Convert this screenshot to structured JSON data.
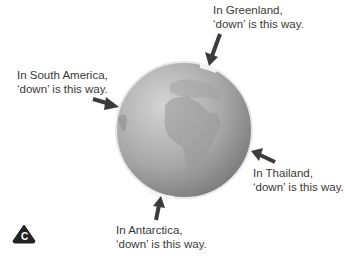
{
  "diagram": {
    "labels": [
      {
        "id": "greenland",
        "line1": "In Greenland,",
        "line2": "‘down’ is this way."
      },
      {
        "id": "south-america",
        "line1": "In South America,",
        "line2": "‘down’ is this way."
      },
      {
        "id": "thailand",
        "line1": "In Thailand,",
        "line2": "‘down’ is this way."
      },
      {
        "id": "antarctica",
        "line1": "In Antarctica,",
        "line2": "‘down’ is this way."
      }
    ],
    "badge": {
      "letter": "C"
    },
    "colors": {
      "arrow": "#3c3c3c",
      "globe_light": "#c8c8c8",
      "globe_dark": "#7a7a7a",
      "text": "#3a3a3a"
    }
  }
}
